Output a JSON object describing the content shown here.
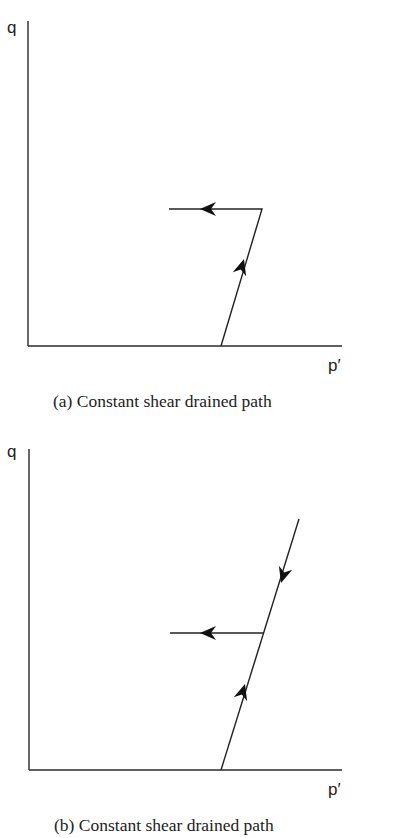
{
  "panels": [
    {
      "id": "a",
      "caption": "(a) Constant shear drained path",
      "y_axis_label": "q",
      "x_axis_label": "p′",
      "segments": [
        {
          "name": "loading-up",
          "direction": "up-right",
          "from": "on p′ axis",
          "to": "corner"
        },
        {
          "name": "constant-shear",
          "direction": "left",
          "from": "corner",
          "to": "end"
        }
      ]
    },
    {
      "id": "b",
      "caption": "(b) Constant shear drained path",
      "y_axis_label": "q",
      "x_axis_label": "p′",
      "segments": [
        {
          "name": "loading-up",
          "direction": "up-right"
        },
        {
          "name": "unloading-down",
          "direction": "down-left"
        },
        {
          "name": "constant-shear",
          "direction": "left"
        }
      ]
    }
  ]
}
